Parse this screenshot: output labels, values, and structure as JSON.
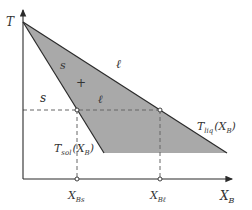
{
  "diagram": {
    "type": "binary phase diagram (solid-liquid)",
    "axes": {
      "y_label": "T",
      "x_label": "X",
      "x_label_sub": "B"
    },
    "colors": {
      "two_phase_fill": "#a9a9a9",
      "line": "#2b2b2b",
      "dashed": "#666666",
      "background": "#ffffff"
    },
    "regions": {
      "solid": "s",
      "liquid": "ℓ",
      "two_phase_s": "s",
      "two_phase_plus": "+",
      "two_phase_l": "ℓ"
    },
    "curves": {
      "solidus": {
        "label": "T",
        "label_sub": "sol",
        "arg": "(X",
        "arg_sub": "B",
        "arg_close": ")"
      },
      "liquidus": {
        "label": "T",
        "label_sub": "liq",
        "arg": "(X",
        "arg_sub": "B",
        "arg_close": ")"
      }
    },
    "ticks": [
      {
        "label": "X",
        "sub": "Bs"
      },
      {
        "label": "X",
        "sub": "Bℓ"
      }
    ]
  }
}
